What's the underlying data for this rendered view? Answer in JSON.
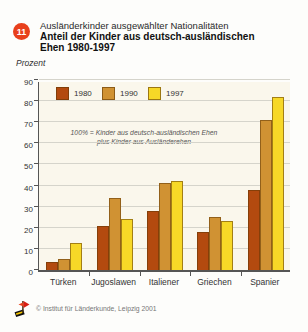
{
  "header": {
    "badge": "11",
    "title_line1": "Ausländerkinder ausgewählter Nationalitäten",
    "title_line2": "Anteil der Kinder aus deutsch-ausländischen",
    "title_line3": "Ehen 1980-1997"
  },
  "ylabel": "Prozent",
  "annotation": {
    "line1": "100% = Kinder aus deutsch-ausländischen Ehen",
    "line2": "plus Kinder aus Ausländerehen"
  },
  "footer": {
    "copyright": "© Institut für Länderkunde, Leipzig 2001"
  },
  "colors": {
    "badge": "#e8401c",
    "series_1980": "#b34a0f",
    "series_1990": "#d09233",
    "series_1997": "#f7d827",
    "plot_background": "#faf7ec",
    "gridline": "#d5d4cb",
    "axis": "#555555"
  },
  "chart_data": {
    "type": "bar",
    "categories": [
      "Türken",
      "Jugoslawen",
      "Italiener",
      "Griechen",
      "Spanier"
    ],
    "series": [
      {
        "name": "1980",
        "color": "#b34a0f",
        "values": [
          4,
          21,
          28,
          18,
          38
        ]
      },
      {
        "name": "1990",
        "color": "#d09233",
        "values": [
          5,
          34,
          41,
          25,
          71
        ]
      },
      {
        "name": "1997",
        "color": "#f7d827",
        "values": [
          13,
          24,
          42,
          23,
          82
        ]
      }
    ],
    "title": "Anteil der Kinder aus deutsch-ausländischen Ehen 1980-1997",
    "subtitle": "Ausländerkinder ausgewählter Nationalitäten",
    "xlabel": "",
    "ylabel": "Prozent",
    "ylim": [
      0,
      90
    ],
    "ytick_step": 10,
    "grid": true,
    "legend_position": "top-left-inside",
    "note": "100% = Kinder aus deutsch-ausländischen Ehen plus Kinder aus Ausländerehen"
  }
}
